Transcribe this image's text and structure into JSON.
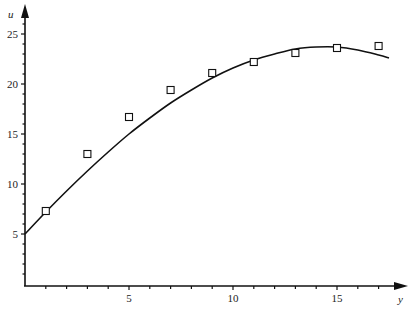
{
  "chart_data": {
    "type": "scatter",
    "title": "",
    "xlabel": "y",
    "ylabel": "u",
    "xlim": [
      0,
      18.5
    ],
    "ylim": [
      0,
      27
    ],
    "xticks": [
      5,
      10,
      15
    ],
    "xtick_labels": [
      "5",
      "10",
      "15"
    ],
    "xminor_step": 1,
    "yticks": [
      5,
      10,
      15,
      20,
      25
    ],
    "ytick_labels": [
      "5",
      "10",
      "15",
      "20",
      "25"
    ],
    "yminor_step": 1,
    "grid": false,
    "legend": null,
    "series": [
      {
        "name": "measured",
        "kind": "scatter",
        "marker": "open-square",
        "x": [
          1,
          3,
          5,
          7,
          9,
          11,
          13,
          15,
          17
        ],
        "y": [
          7.3,
          13.0,
          16.7,
          19.4,
          21.1,
          22.2,
          23.1,
          23.6,
          23.8
        ]
      },
      {
        "name": "fitted curve",
        "kind": "line",
        "x": [
          0,
          1,
          2,
          3,
          4,
          5,
          6,
          7,
          8,
          9,
          10,
          11,
          12,
          13,
          14,
          15,
          16,
          17,
          17.5
        ],
        "y": [
          5.0,
          7.2,
          9.3,
          11.3,
          13.2,
          15.0,
          16.6,
          18.1,
          19.4,
          20.6,
          21.6,
          22.4,
          23.0,
          23.5,
          23.7,
          23.7,
          23.4,
          22.9,
          22.6
        ]
      }
    ]
  },
  "axes": {
    "x_label": "y",
    "y_label": "u"
  }
}
